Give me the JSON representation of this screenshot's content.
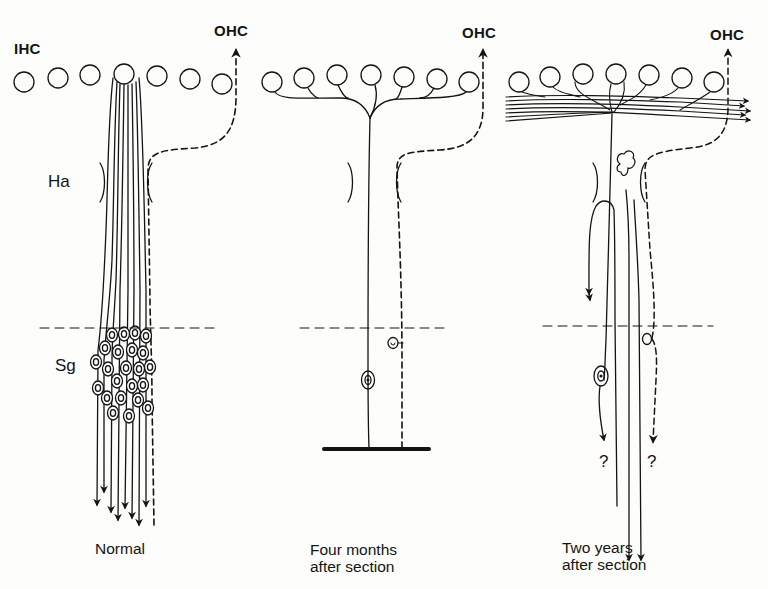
{
  "figure": {
    "labels": {
      "ihc": "IHC",
      "ha": "Ha",
      "sg": "Sg"
    },
    "panels": [
      {
        "id": "normal",
        "caption_lines": [
          "Normal"
        ],
        "ohc_label": "OHC"
      },
      {
        "id": "four-months",
        "caption_lines": [
          "Four months",
          "after section"
        ],
        "ohc_label": "OHC"
      },
      {
        "id": "two-years",
        "caption_lines": [
          "Two years",
          "after section"
        ],
        "ohc_label": "OHC",
        "unknown_marks": [
          "?",
          "?"
        ]
      }
    ],
    "colors": {
      "ink": "#141414",
      "paper": "#fdfdfb"
    }
  }
}
